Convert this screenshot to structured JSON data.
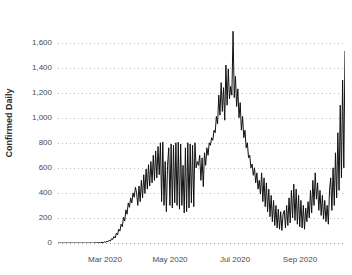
{
  "chart_data": {
    "type": "line",
    "title": "",
    "title_sliver_text": "",
    "xlabel": "",
    "ylabel": "Confirmed Daily",
    "ylim": [
      0,
      1700
    ],
    "yticks": [
      0,
      200,
      400,
      600,
      800,
      1000,
      1200,
      1400,
      1600
    ],
    "ytick_labels": [
      "0",
      "200",
      "400",
      "600",
      "800",
      "1,000",
      "1,200",
      "1,400",
      "1,600"
    ],
    "xtick_labels": [
      "Mar 2020",
      "May 2020",
      "Jul 2020",
      "Sep 2020"
    ],
    "xtick_positions": [
      105,
      170,
      235,
      300
    ],
    "grid": true,
    "grid_style": "dotted-horizontal",
    "legend": "none",
    "line_color": "#111111",
    "grid_color": "#bdbdbd",
    "background_color": "#ffffff",
    "axis_text_color": "#4a4a4a",
    "x_start": "2020-01-22",
    "x_end": "2020-09-22",
    "x_unit": "day",
    "series": [
      {
        "name": "Confirmed Daily",
        "values": [
          0,
          0,
          0,
          0,
          0,
          0,
          0,
          0,
          0,
          0,
          0,
          0,
          0,
          0,
          0,
          0,
          0,
          0,
          0,
          0,
          0,
          0,
          0,
          0,
          0,
          0,
          0,
          0,
          0,
          0,
          0,
          2,
          0,
          3,
          1,
          4,
          2,
          6,
          3,
          9,
          6,
          14,
          10,
          22,
          16,
          35,
          28,
          52,
          40,
          78,
          64,
          110,
          95,
          150,
          130,
          205,
          175,
          265,
          230,
          320,
          285,
          360,
          320,
          400,
          365,
          445,
          400,
          300,
          455,
          330,
          500,
          360,
          545,
          395,
          590,
          430,
          625,
          455,
          650,
          480,
          700,
          500,
          735,
          520,
          770,
          545,
          800,
          330,
          805,
          300,
          650,
          250,
          620,
          760,
          300,
          790,
          280,
          780,
          320,
          800,
          300,
          805,
          270,
          790,
          300,
          620,
          240,
          760,
          250,
          800,
          280,
          790,
          320,
          780,
          290,
          800,
          600,
          650,
          620,
          700,
          500,
          680,
          450,
          720,
          620,
          760,
          700,
          800,
          780,
          840,
          820,
          900,
          880,
          1010,
          950,
          1180,
          1020,
          1280,
          1050,
          1240,
          980,
          1420,
          1100,
          1390,
          1150,
          1250,
          1180,
          1690,
          1160,
          1330,
          1090,
          1230,
          1000,
          1120,
          900,
          1010,
          840,
          900,
          760,
          800,
          680,
          700,
          600,
          630,
          540,
          600,
          480,
          560,
          430,
          500,
          390,
          560,
          330,
          520,
          290,
          480,
          250,
          430,
          210,
          380,
          170,
          340,
          140,
          300,
          120,
          270,
          110,
          250,
          100,
          230,
          260,
          120,
          300,
          140,
          360,
          160,
          420,
          200,
          470,
          180,
          430,
          150,
          380,
          130,
          340,
          120,
          300,
          110,
          280,
          170,
          330,
          200,
          420,
          240,
          500,
          300,
          560,
          350,
          480,
          260,
          420,
          220,
          380,
          190,
          340,
          170,
          300,
          150,
          420,
          520,
          260,
          600,
          300,
          720,
          360,
          880,
          420,
          1100,
          520,
          1300,
          600,
          1530
        ]
      }
    ],
    "annotations": {
      "peak_value": 1690,
      "peak_label": "late June / early July 2020 peak",
      "final_spike_value": 1530
    }
  },
  "axes": {
    "y_top_value": 1600,
    "y_top_px": 30,
    "y_zero_px": 243,
    "plot_left_px": 58,
    "plot_right_px": 345
  }
}
